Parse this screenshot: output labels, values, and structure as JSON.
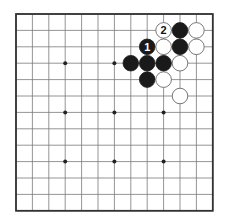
{
  "diagram": {
    "type": "go-board-diagram",
    "board_size": 13,
    "origin": {
      "x": 16,
      "y": 14
    },
    "spacing": 16.4,
    "colors": {
      "background": "#ffffff",
      "line": "#7a7a7a",
      "border": "#333333",
      "black": "#1a1a1a",
      "black_alt": "#3a3a3a",
      "white": "#ffffff",
      "white_stroke": "#555555",
      "hoshi": "#222222"
    },
    "hoshi": [
      [
        3,
        3
      ],
      [
        6,
        3
      ],
      [
        3,
        6
      ],
      [
        6,
        6
      ],
      [
        9,
        6
      ],
      [
        3,
        9
      ],
      [
        6,
        9
      ],
      [
        9,
        9
      ]
    ],
    "stones": [
      {
        "col": 9,
        "row": 1,
        "color": "white",
        "label": "2"
      },
      {
        "col": 10,
        "row": 1,
        "color": "black",
        "label": ""
      },
      {
        "col": 11,
        "row": 1,
        "color": "white",
        "label": ""
      },
      {
        "col": 8,
        "row": 2,
        "color": "black",
        "label": "1"
      },
      {
        "col": 9,
        "row": 2,
        "color": "white",
        "label": ""
      },
      {
        "col": 10,
        "row": 2,
        "color": "black",
        "label": ""
      },
      {
        "col": 11,
        "row": 2,
        "color": "white",
        "label": ""
      },
      {
        "col": 7,
        "row": 3,
        "color": "black",
        "label": ""
      },
      {
        "col": 8,
        "row": 3,
        "color": "black",
        "label": ""
      },
      {
        "col": 9,
        "row": 3,
        "color": "black",
        "label": ""
      },
      {
        "col": 10,
        "row": 3,
        "color": "white",
        "label": ""
      },
      {
        "col": 8,
        "row": 4,
        "color": "black",
        "label": ""
      },
      {
        "col": 9,
        "row": 4,
        "color": "white",
        "label": ""
      },
      {
        "col": 10,
        "row": 5,
        "color": "white",
        "label": ""
      }
    ]
  }
}
